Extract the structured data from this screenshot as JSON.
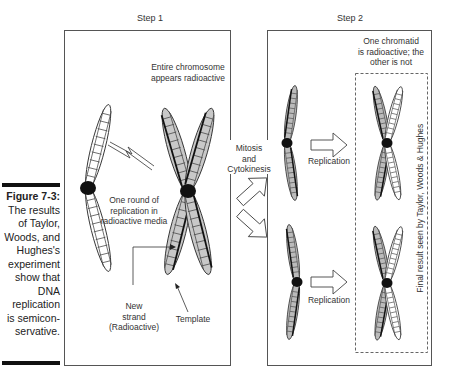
{
  "figure": {
    "label": "Figure 7-3:",
    "caption_lines": [
      "The results",
      "of Taylor,",
      "Woods, and",
      "Hughes's",
      "experiment",
      "show that",
      "DNA",
      "replication",
      "is semicon-",
      "servative."
    ]
  },
  "step1": {
    "title": "Step 1",
    "top_note": [
      "Entire chromosome",
      "appears radioactive"
    ],
    "middle_note": [
      "One round of",
      "replication in",
      "radioactive media"
    ],
    "new_strand_label": [
      "New",
      "strand",
      "(Radioactive)"
    ],
    "template_label": "Template"
  },
  "transition": {
    "label": [
      "Mitosis",
      "and",
      "Cytokinesis"
    ]
  },
  "step2": {
    "title": "Step 2",
    "top_note": [
      "One chromatid",
      "is radioactive; the",
      "other is not"
    ],
    "replication_label_top": "Replication",
    "replication_label_bottom": "Replication",
    "vertical_note": "Final result seen by Taylor, Woods & Hughes"
  },
  "colors": {
    "radioactive_fill": "#c8c8c8",
    "line": "#222222",
    "box_border": "#555555"
  }
}
